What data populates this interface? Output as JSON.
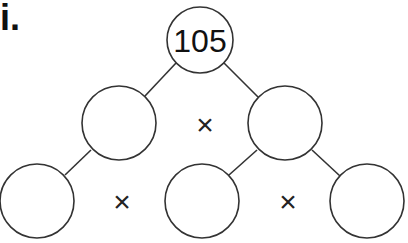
{
  "problem_label": "i.",
  "factor_tree": {
    "root": {
      "value": "105"
    },
    "operator_symbol": "×",
    "nodes": [
      {
        "id": "root",
        "cx": 200,
        "cy": 40,
        "r": 33,
        "value": "105"
      },
      {
        "id": "mid-left",
        "cx": 119,
        "cy": 123,
        "r": 37,
        "value": ""
      },
      {
        "id": "mid-right",
        "cx": 285,
        "cy": 123,
        "r": 37,
        "value": ""
      },
      {
        "id": "bottom-left",
        "cx": 37,
        "cy": 201,
        "r": 37,
        "value": ""
      },
      {
        "id": "bottom-middle",
        "cx": 202,
        "cy": 201,
        "r": 37,
        "value": ""
      },
      {
        "id": "bottom-right",
        "cx": 367,
        "cy": 201,
        "r": 37,
        "value": ""
      }
    ],
    "operators": [
      {
        "between": [
          "mid-left",
          "mid-right"
        ],
        "x": 205,
        "y": 124,
        "symbol": "×"
      },
      {
        "between": [
          "bottom-left",
          "bottom-middle"
        ],
        "x": 122,
        "y": 201,
        "symbol": "×"
      },
      {
        "between": [
          "bottom-middle",
          "bottom-right"
        ],
        "x": 288,
        "y": 201,
        "symbol": "×"
      }
    ],
    "colors": {
      "stroke": "#333333",
      "text": "#111111",
      "background": "#ffffff"
    }
  }
}
